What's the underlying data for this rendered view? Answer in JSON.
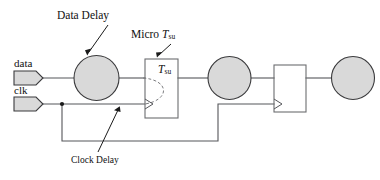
{
  "figure": {
    "type": "timing-path-circuit-diagram",
    "title_visible": false,
    "background_color": "#ffffff",
    "ink_color": "#55565a",
    "fill_color": "#d9d9d9"
  },
  "annotations": {
    "data_delay": {
      "label": "Data Delay",
      "points_to": "data-delay-circle"
    },
    "micro_tsu": {
      "label_prefix": "Micro ",
      "label_symbol": "T",
      "label_subscript": "su",
      "points_to": "tsu-flipflop"
    },
    "clock_delay": {
      "label": "Clock Delay",
      "points_to": "clock-delay-wire"
    }
  },
  "ports": {
    "data": {
      "label": "data"
    },
    "clk": {
      "label": "clk"
    }
  },
  "blocks": {
    "tsu_flipflop": {
      "label_symbol": "T",
      "label_subscript": "su"
    },
    "second_flipflop": {
      "label": ""
    }
  },
  "nodes": [
    {
      "name": "data-delay-circle",
      "kind": "delay-circle"
    },
    {
      "name": "tsu-flipflop",
      "kind": "flip-flop"
    },
    {
      "name": "mid-delay-circle",
      "kind": "delay-circle"
    },
    {
      "name": "second-flipflop",
      "kind": "flip-flop"
    },
    {
      "name": "output-delay-circle",
      "kind": "delay-circle"
    }
  ]
}
